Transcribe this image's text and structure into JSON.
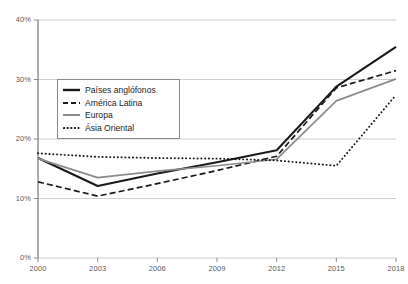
{
  "chart_data": {
    "type": "line",
    "title": "",
    "subtitle": "",
    "xlabel": "",
    "ylabel": "",
    "x": [
      2000,
      2003,
      2006,
      2009,
      2012,
      2015,
      2018
    ],
    "xtick_labels": [
      "2000",
      "2003",
      "2006",
      "2009",
      "2012",
      "2015",
      "2018"
    ],
    "ytick_labels": [
      "0%",
      "10%",
      "20%",
      "30%",
      "40%"
    ],
    "ytick_values": [
      0,
      10,
      20,
      30,
      40
    ],
    "xlim": [
      2000,
      2018
    ],
    "ylim": [
      0,
      40
    ],
    "grid": "horizontal",
    "legend_position": "upper-left-inside",
    "series": [
      {
        "name": "Países anglófonos",
        "style": "solid",
        "color": "#1a1a1a",
        "width": 2.1,
        "values": [
          16.8,
          12.1,
          14.2,
          16.1,
          18.1,
          28.8,
          35.5
        ]
      },
      {
        "name": "América Latina",
        "style": "dashed",
        "color": "#1a1a1a",
        "width": 1.7,
        "values": [
          12.8,
          10.4,
          12.5,
          14.7,
          17.1,
          28.6,
          31.5
        ]
      },
      {
        "name": "Europa",
        "style": "solid",
        "color": "#8c8c8c",
        "width": 1.7,
        "values": [
          16.7,
          13.5,
          14.6,
          15.5,
          16.6,
          26.4,
          30.1
        ]
      },
      {
        "name": "Ásia Oriental",
        "style": "dotted",
        "color": "#1a1a1a",
        "width": 1.9,
        "values": [
          17.6,
          17.0,
          16.8,
          16.7,
          16.4,
          15.5,
          27.4
        ]
      }
    ]
  },
  "axes": {
    "axis_color": "#7a7a7a",
    "grid_color": "#c9c9c9",
    "tick_color": "#8a8a8a"
  }
}
